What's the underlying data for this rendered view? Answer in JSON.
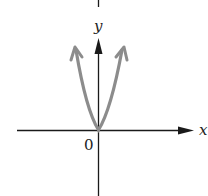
{
  "figure": {
    "x_axis_label": "x",
    "y_axis_label": "y",
    "origin_label": "0",
    "colors": {
      "axes": "#1a1a1a",
      "curve": "#8c8c8c",
      "background": "#ffffff"
    }
  }
}
